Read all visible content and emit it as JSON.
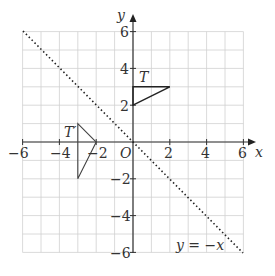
{
  "diagram": {
    "type": "coordinate-grid",
    "x_axis_label": "x",
    "y_axis_label": "y",
    "origin_label": "O",
    "x_ticks": [
      "−6",
      "−4",
      "−2",
      "2",
      "4",
      "6"
    ],
    "y_ticks": [
      "6",
      "4",
      "2",
      "−2",
      "−4",
      "−6"
    ],
    "x_range": [
      -6,
      6
    ],
    "y_range": [
      -6,
      6
    ],
    "grid_spacing": 1,
    "line_label": "y = −x",
    "shapes": [
      {
        "name": "T",
        "vertices": [
          [
            0,
            3
          ],
          [
            2,
            3
          ],
          [
            0,
            2
          ]
        ]
      },
      {
        "name": "T′",
        "vertices": [
          [
            -3,
            1
          ],
          [
            -2,
            0
          ],
          [
            -3,
            -2
          ]
        ]
      }
    ],
    "label_T": "T",
    "label_T_prime": "T′",
    "colors": {
      "grid": "#d0d0d0",
      "axis": "#333333",
      "shape": "#222222",
      "line": "#222222"
    }
  }
}
